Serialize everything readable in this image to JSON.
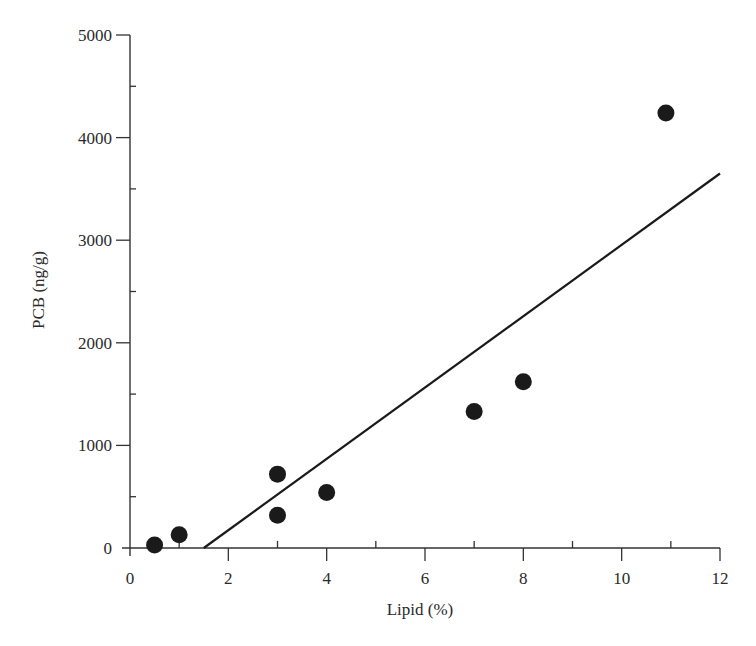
{
  "chart_data": {
    "type": "scatter",
    "title": "",
    "xlabel": "Lipid (%)",
    "ylabel": "PCB (ng/g)",
    "xlim": [
      0,
      12
    ],
    "ylim": [
      0,
      5000
    ],
    "grid": false,
    "legend": null,
    "x_ticks": [
      0,
      2,
      4,
      6,
      8,
      10,
      12
    ],
    "x_tick_labels": [
      "0",
      "2",
      "4",
      "6",
      "8",
      "10",
      "12"
    ],
    "x_minor_ticks": [
      1,
      3,
      5,
      7,
      9,
      11
    ],
    "y_ticks": [
      0,
      1000,
      2000,
      3000,
      4000,
      5000
    ],
    "y_tick_labels": [
      "0",
      "1000",
      "2000",
      "3000",
      "4000",
      "5000"
    ],
    "y_minor_ticks": [
      500,
      1500,
      2500,
      3500,
      4500
    ],
    "series": [
      {
        "name": "samples",
        "kind": "scatter",
        "marker": "filled-circle",
        "color": "#1a1a1a",
        "x": [
          0.5,
          1.0,
          3.0,
          3.0,
          4.0,
          7.0,
          8.0,
          10.9
        ],
        "y": [
          30,
          130,
          720,
          320,
          540,
          1330,
          1620,
          4240
        ]
      },
      {
        "name": "regression-line",
        "kind": "line",
        "color": "#1a1a1a",
        "x": [
          1.5,
          12
        ],
        "y": [
          0,
          3650
        ]
      }
    ]
  }
}
